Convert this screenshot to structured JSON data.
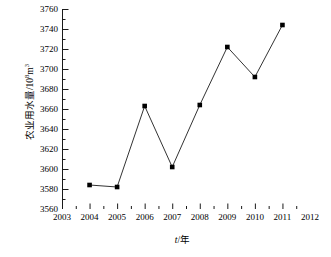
{
  "chart_data": {
    "type": "line",
    "title": "",
    "xlabel": "t/年",
    "xlabel_italic_part": "t",
    "xlabel_rest": "/年",
    "ylabel": "农业用水量/10⁸m³",
    "ylabel_main": "农业用水量/10",
    "ylabel_exp": "8",
    "ylabel_unit": "m",
    "ylabel_unit_exp": "3",
    "x": [
      2004,
      2005,
      2006,
      2007,
      2008,
      2009,
      2010,
      2011
    ],
    "values": [
      3584,
      3582,
      3663,
      3602,
      3664,
      3722,
      3692,
      3744
    ],
    "xlim": [
      2003,
      2012
    ],
    "ylim": [
      3560,
      3760
    ],
    "xticks": [
      2003,
      2004,
      2005,
      2006,
      2007,
      2008,
      2009,
      2010,
      2011,
      2012
    ],
    "yticks": [
      3560,
      3580,
      3600,
      3620,
      3640,
      3660,
      3680,
      3700,
      3720,
      3740,
      3760
    ],
    "y_minor_step": 10,
    "grid": false,
    "legend": null,
    "marker": "square",
    "marker_color": "#000000",
    "line_color": "#333333",
    "series_name": "农业用水量"
  },
  "axis": {
    "ytick_labels": [
      "3760",
      "3740",
      "3720",
      "3700",
      "3680",
      "3660",
      "3640",
      "3620",
      "3600",
      "3580",
      "3560"
    ],
    "xtick_labels": [
      "2003",
      "2004",
      "2005",
      "2006",
      "2007",
      "2008",
      "2009",
      "2010",
      "2011",
      "2012"
    ]
  }
}
